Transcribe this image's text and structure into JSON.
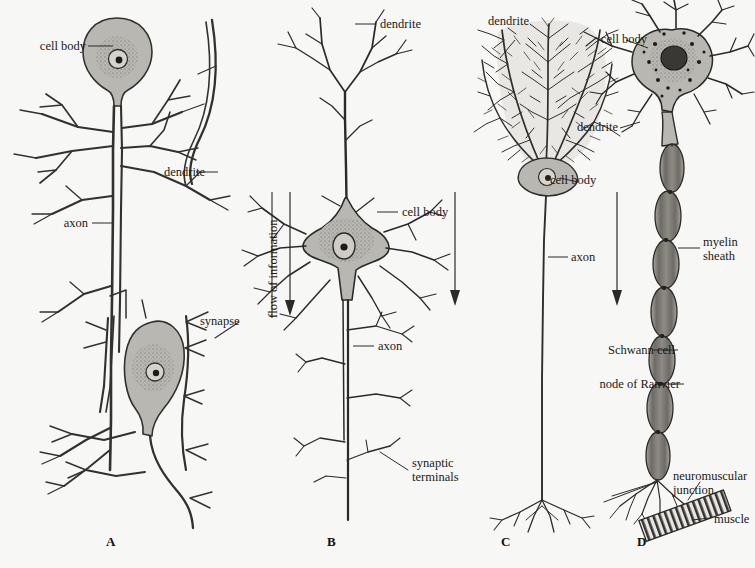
{
  "figure": {
    "background_color": "#f7f7f5",
    "ink_color": "#2a2a28",
    "soma_fill": "#b9b7b2"
  },
  "flow": {
    "axis_label": "flow of information",
    "arrow_count": 3
  },
  "panels": [
    {
      "letter": "A",
      "name": "sensory-neuron-panel",
      "labels": [
        {
          "id": "a-cell-body-1",
          "text": "cell body"
        },
        {
          "id": "a-dendrite",
          "text": "dendrite"
        },
        {
          "id": "a-axon",
          "text": "axon"
        },
        {
          "id": "a-synapse",
          "text": "synapse"
        }
      ]
    },
    {
      "letter": "B",
      "name": "pyramidal-neuron-panel",
      "labels": [
        {
          "id": "b-dendrite",
          "text": "dendrite"
        },
        {
          "id": "b-cell-body",
          "text": "cell body"
        },
        {
          "id": "b-axon",
          "text": "axon"
        },
        {
          "id": "b-synaptic-terminals",
          "text": "synaptic\nterminals"
        }
      ]
    },
    {
      "letter": "C",
      "name": "purkinje-neuron-panel",
      "labels": [
        {
          "id": "c-dendrite",
          "text": "dendrite"
        },
        {
          "id": "c-cell-body",
          "text": "cell body"
        },
        {
          "id": "c-axon",
          "text": "axon"
        }
      ]
    },
    {
      "letter": "D",
      "name": "motor-neuron-panel",
      "labels": [
        {
          "id": "d-cell-body",
          "text": "cell body"
        },
        {
          "id": "d-dendrite",
          "text": "dendrite"
        },
        {
          "id": "d-myelin-sheath",
          "text": "myelin\nsheath"
        },
        {
          "id": "d-schwann-cell",
          "text": "Schwann cell"
        },
        {
          "id": "d-node-of-ranvier",
          "text": "node of Ranvier"
        },
        {
          "id": "d-neuromuscular-junction",
          "text": "neuromuscular\njunction"
        },
        {
          "id": "d-muscle",
          "text": "muscle"
        }
      ]
    }
  ],
  "text": {
    "a_cell_body": "cell body",
    "a_dendrite": "dendrite",
    "a_axon": "axon",
    "a_synapse": "synapse",
    "a_letter": "A",
    "b_dendrite": "dendrite",
    "b_cell_body": "cell body",
    "b_axon": "axon",
    "b_synaptic_1": "synaptic",
    "b_synaptic_2": "terminals",
    "b_letter": "B",
    "c_dendrite": "dendrite",
    "c_cell_body": "cell body",
    "c_axon": "axon",
    "c_letter": "C",
    "d_cell_body": "cell body",
    "d_dendrite": "dendrite",
    "d_myelin_1": "myelin",
    "d_myelin_2": "sheath",
    "d_schwann": "Schwann cell",
    "d_node": "node of Ranvier",
    "d_nmj_1": "neuromuscular",
    "d_nmj_2": "junction",
    "d_muscle": "muscle",
    "d_letter": "D",
    "flow_label": "flow of information"
  }
}
